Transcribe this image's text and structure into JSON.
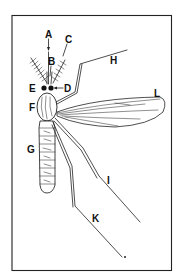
{
  "caption": "",
  "diagram": {
    "labels": {
      "A": "A",
      "B": "B",
      "C": "C",
      "D": "D",
      "E": "E",
      "F": "F",
      "G": "G",
      "H": "H",
      "I": "I",
      "K": "K",
      "L": "L"
    },
    "colors": {
      "ink": "#222222",
      "background": "#ffffff"
    }
  }
}
